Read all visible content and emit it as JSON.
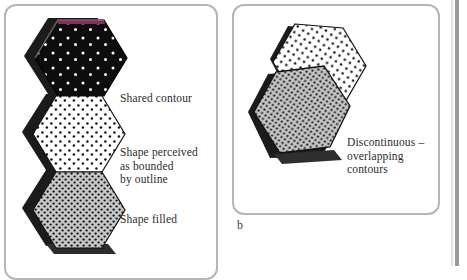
{
  "figure": {
    "kind": "two-panel illustration of hexagon shapes with dot textures",
    "background_color": "#ffffff",
    "panel_border_color": "#b5b5b5"
  },
  "panels": [
    {
      "id": "a",
      "caption": "",
      "shapes": [
        {
          "name": "dark-hexagon",
          "fill": "#0d0d0d",
          "dot_color": "#ffffff",
          "outline": "#000000",
          "accent_edge_color": "#8d2a63",
          "description": "black hexagon with sparse white dots and a magenta top edge"
        },
        {
          "name": "white-hexagon",
          "fill": "#ffffff",
          "dot_color": "#111111",
          "outline": "#000000",
          "description": "white hexagon with medium-density black dots"
        },
        {
          "name": "gray-hexagon",
          "fill": "#c6c6c6",
          "dot_color": "#141414",
          "outline": "#000000",
          "description": "gray hexagon with dense black dots"
        }
      ],
      "labels": [
        {
          "id": "shared-contour",
          "text": "Shared contour"
        },
        {
          "id": "shape-perceived",
          "text": "Shape perceived\nas bounded\nby outline"
        },
        {
          "id": "shape-filled",
          "text": "Shape filled"
        }
      ]
    },
    {
      "id": "b",
      "caption": "b",
      "shapes": [
        {
          "name": "white-hexagon",
          "fill": "#ffffff",
          "dot_color": "#111111",
          "outline": "#000000",
          "description": "tilted white hexagon with black dots, partly occluded"
        },
        {
          "name": "gray-hexagon",
          "fill": "#c6c6c6",
          "dot_color": "#141414",
          "outline": "#000000",
          "description": "tilted gray hexagon with dense black dots overlapping the white one"
        }
      ],
      "labels": [
        {
          "id": "discontinuous",
          "text": "Discontinuous –\noverlapping\ncontours"
        }
      ]
    }
  ],
  "colors": {
    "shadow": "#1a1a1a",
    "shadow_soft": "#3a3a3a",
    "rail": "#9a9a9a",
    "text": "#2b2b2b"
  }
}
